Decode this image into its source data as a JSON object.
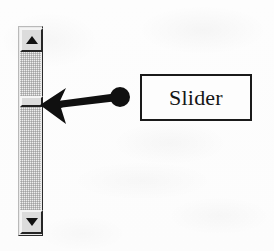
{
  "figure": {
    "kind": "annotated-ui-illustration",
    "background_color": "#fdfdfd"
  },
  "scrollbar": {
    "orientation": "vertical",
    "track": {
      "name": "scrollbar-track",
      "fill_style": "dithered-checker-gray",
      "color": "#efefef"
    },
    "arrow_up": {
      "icon": "triangle-up-icon",
      "glyph": "▲",
      "color": "#111111",
      "face_color": "#dcdcdc"
    },
    "arrow_down": {
      "icon": "triangle-down-icon",
      "glyph": "▼",
      "color": "#111111",
      "face_color": "#dcdcdc"
    },
    "thumb": {
      "name": "slider-thumb",
      "face_color": "#dadada",
      "highlight_color": "#f6f6f6",
      "shadow_color": "#1f1f1f"
    }
  },
  "callout": {
    "label": "Slider",
    "label_box": {
      "border_color": "#1a1a1a",
      "fill_color": "#fdfdfd"
    },
    "leader": {
      "color": "#101010",
      "dot_center": {
        "x": 120,
        "y": 97
      },
      "dot_radius": 10,
      "arrow_tip": {
        "x": 40,
        "y": 105
      },
      "arrowhead_style": "barbed"
    }
  }
}
